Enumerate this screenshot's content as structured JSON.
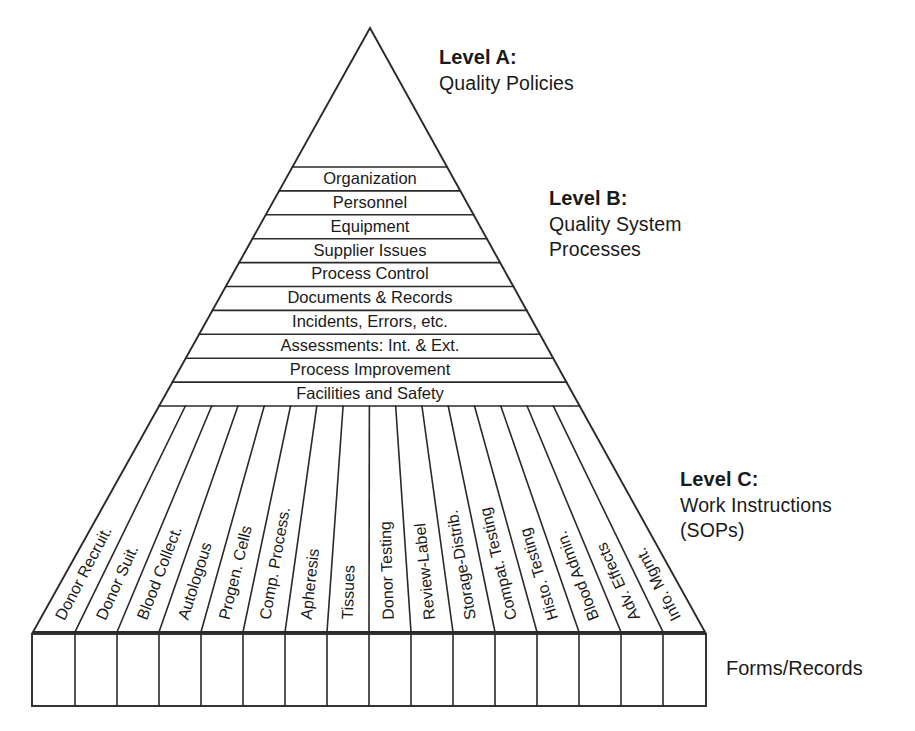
{
  "diagram": {
    "levels": [
      {
        "id": "A",
        "heading": "Level A:",
        "subtitle": "Quality Policies"
      },
      {
        "id": "B",
        "heading": "Level B:",
        "subtitle": "Quality System\nProcesses"
      },
      {
        "id": "C",
        "heading": "Level C:",
        "subtitle": "Work Instructions\n(SOPs)"
      }
    ],
    "level_b_bands": [
      "Organization",
      "Personnel",
      "Equipment",
      "Supplier Issues",
      "Process Control",
      "Documents & Records",
      "Incidents, Errors, etc.",
      "Assessments: Int. & Ext.",
      "Process Improvement",
      "Facilities and Safety"
    ],
    "level_c_columns": [
      "Donor Recruit.",
      "Donor Suit.",
      "Blood Collect.",
      "Autologous",
      "Progen. Cells",
      "Comp. Process.",
      "Apheresis",
      "Tissues",
      "Donor Testing",
      "Review-Label",
      "Storage-Distrib.",
      "Compat. Testing",
      "Histo. Testing",
      "Blood Admin.",
      "Adv. Effects",
      "Info. Mgmt."
    ],
    "footer_label": "Forms/Records",
    "colors": {
      "stroke": "#2a2a2a",
      "text": "#1a1a1a",
      "background": "#ffffff"
    },
    "geometry": {
      "apex_x": 370,
      "apex_y": 28,
      "base_left_x": 33,
      "base_right_x": 705,
      "base_y": 632,
      "level_b_top_y": 167,
      "level_b_bottom_y": 406,
      "box_top_y": 634,
      "box_bottom_y": 706
    }
  }
}
